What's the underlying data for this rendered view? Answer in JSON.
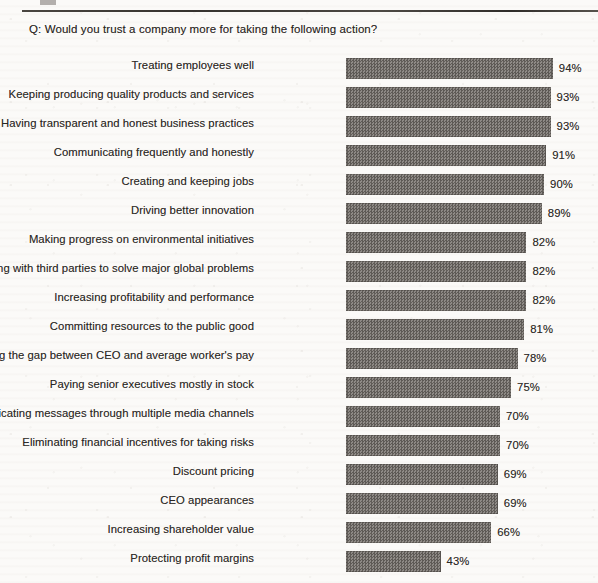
{
  "header": {
    "question": "Q: Would you trust a company more for taking the following action?"
  },
  "chart_data": {
    "type": "bar",
    "orientation": "horizontal",
    "title": "Q: Would you trust a company more for taking the following action?",
    "xlabel": "",
    "ylabel": "",
    "xlim": [
      0,
      100
    ],
    "grid": false,
    "legend": null,
    "value_suffix": "%",
    "categories": [
      "Treating employees well",
      "Keeping producing quality products and services",
      "Having transparent and honest business practices",
      "Communicating frequently and honestly",
      "Creating and keeping jobs",
      "Driving better innovation",
      "Making progress on environmental initiatives",
      "Partnering with third parties to solve major global problems",
      "Increasing profitability and performance",
      "Committing resources to the public good",
      "Reducing the gap between CEO and average worker's pay",
      "Paying senior executives mostly in stock",
      "Communicating messages through multiple media channels",
      "Eliminating financial incentives for taking risks",
      "Discount pricing",
      "CEO appearances",
      "Increasing shareholder value",
      "Protecting profit margins"
    ],
    "values": [
      94,
      93,
      93,
      91,
      90,
      89,
      82,
      82,
      82,
      81,
      78,
      75,
      70,
      70,
      69,
      69,
      66,
      43
    ],
    "value_labels": [
      "94%",
      "93%",
      "93%",
      "91%",
      "90%",
      "89%",
      "82%",
      "82%",
      "82%",
      "81%",
      "78%",
      "75%",
      "70%",
      "70%",
      "69%",
      "69%",
      "66%",
      "43%"
    ],
    "bar_color": "#6e6a66",
    "background_color": "#fbfaf8"
  }
}
